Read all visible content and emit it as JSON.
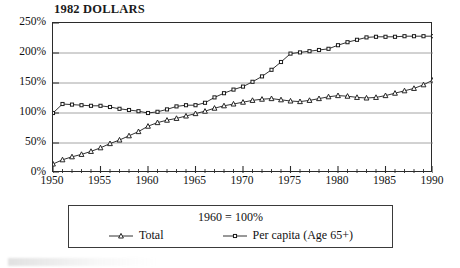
{
  "chart_data": {
    "type": "line",
    "title": "1982 DOLLARS",
    "xlabel": "",
    "ylabel": "",
    "xlim": [
      1950,
      1990
    ],
    "ylim": [
      0,
      250
    ],
    "grid": true,
    "gridlines_y": [
      50,
      100,
      150,
      200
    ],
    "legend_position": "below-plot",
    "legend_note": "1960  =  100%",
    "y_ticks": [
      "0%",
      "50%",
      "100%",
      "150%",
      "200%",
      "250%"
    ],
    "y_tick_values": [
      0,
      50,
      100,
      150,
      200,
      250
    ],
    "x_ticks": [
      "1950",
      "1955",
      "1960",
      "1965",
      "1970",
      "1975",
      "1980",
      "1985",
      "1990"
    ],
    "x_tick_values": [
      1950,
      1955,
      1960,
      1965,
      1970,
      1975,
      1980,
      1985,
      1990
    ],
    "x_minor_tick_step": 1,
    "x": [
      1950,
      1951,
      1952,
      1953,
      1954,
      1955,
      1956,
      1957,
      1958,
      1959,
      1960,
      1961,
      1962,
      1963,
      1964,
      1965,
      1966,
      1967,
      1968,
      1969,
      1970,
      1971,
      1972,
      1973,
      1974,
      1975,
      1976,
      1977,
      1978,
      1979,
      1980,
      1981,
      1982,
      1983,
      1984,
      1985,
      1986,
      1987,
      1988,
      1989,
      1990
    ],
    "series": [
      {
        "name": "Total",
        "marker": "triangle",
        "values": [
          15,
          22,
          27,
          31,
          36,
          42,
          49,
          55,
          62,
          69,
          78,
          84,
          88,
          91,
          95,
          99,
          103,
          108,
          112,
          115,
          118,
          121,
          123,
          124,
          122,
          120,
          119,
          121,
          124,
          127,
          129,
          128,
          126,
          125,
          126,
          129,
          133,
          137,
          141,
          147,
          155
        ]
      },
      {
        "name": "Per capita (Age 65+)",
        "marker": "square",
        "values": [
          100,
          115,
          114,
          113,
          112,
          112,
          110,
          107,
          105,
          103,
          100,
          102,
          106,
          111,
          113,
          113,
          117,
          126,
          133,
          139,
          144,
          152,
          161,
          172,
          185,
          199,
          201,
          203,
          205,
          207,
          213,
          218,
          222,
          226,
          227,
          227,
          227,
          228,
          228,
          228,
          228
        ]
      }
    ]
  },
  "legend": {
    "note": "1960  =  100%",
    "entries": [
      {
        "label": "Total"
      },
      {
        "label": "Per capita (Age 65+)"
      }
    ]
  },
  "colors": {
    "line": "#1b1b1b",
    "grid": "#8d8d8d",
    "frame": "#2b2b2b",
    "text": "#111111",
    "background": "#ffffff"
  }
}
